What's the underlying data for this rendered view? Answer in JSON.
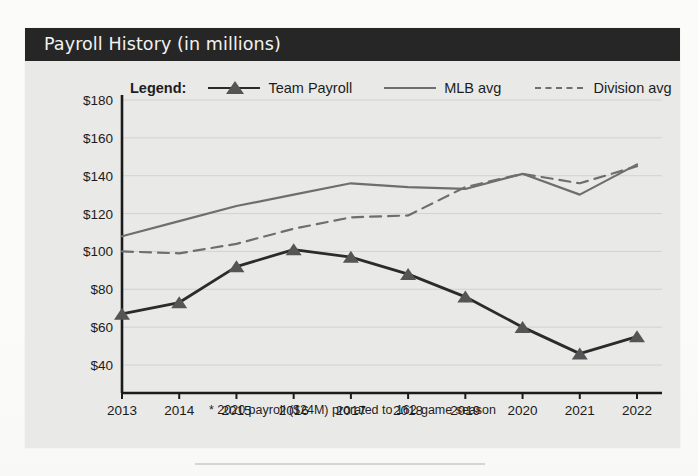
{
  "panel": {
    "title": "Payroll History (in millions)",
    "footnote": "* 2020 payroll ($24M) prorated to 162-game season"
  },
  "legend": {
    "title": "Legend:",
    "entries": [
      {
        "label": "Team Payroll",
        "style": "line-marker",
        "color": "#2b2b2b"
      },
      {
        "label": "MLB avg",
        "style": "solid",
        "color": "#6e6e6e"
      },
      {
        "label": "Division avg",
        "style": "dashed",
        "color": "#6e6e6e"
      }
    ]
  },
  "chart_data": {
    "type": "line",
    "title": "Payroll History (in millions)",
    "xlabel": "",
    "ylabel": "",
    "x": [
      2013,
      2014,
      2015,
      2016,
      2017,
      2018,
      2019,
      2020,
      2021,
      2022
    ],
    "categories": [
      "2013",
      "2014",
      "2015",
      "2016",
      "2017",
      "2018",
      "2019",
      "2020",
      "2021",
      "2022"
    ],
    "ylim": [
      40,
      180
    ],
    "ytick_values": [
      40,
      60,
      80,
      100,
      120,
      140,
      160,
      180
    ],
    "ytick_labels": [
      "$40",
      "$60",
      "$80",
      "$100",
      "$120",
      "$140",
      "$160",
      "$180"
    ],
    "grid": true,
    "legend_position": "top",
    "series": [
      {
        "name": "Team Payroll",
        "color": "#2b2b2b",
        "style": "solid",
        "marker": "triangle",
        "values": [
          67,
          73,
          92,
          101,
          97,
          88,
          76,
          60,
          46,
          55
        ]
      },
      {
        "name": "MLB avg",
        "color": "#6e6e6e",
        "style": "solid",
        "marker": "none",
        "values": [
          108,
          116,
          124,
          130,
          136,
          134,
          133,
          141,
          130,
          146
        ]
      },
      {
        "name": "Division avg",
        "color": "#6e6e6e",
        "style": "dashed",
        "marker": "none",
        "values": [
          100,
          99,
          104,
          112,
          118,
          119,
          134,
          141,
          136,
          145
        ]
      }
    ],
    "annotations": [
      "* 2020 payroll ($24M) prorated to 162-game season"
    ]
  }
}
